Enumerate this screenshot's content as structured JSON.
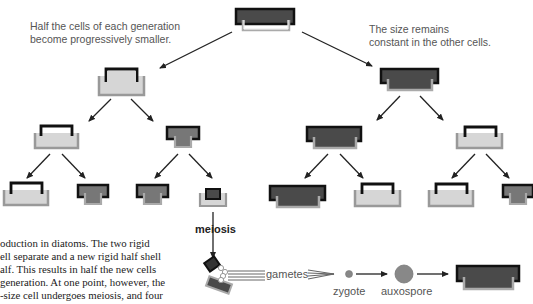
{
  "annotations": {
    "left_note_line1": "Half the cells of each generation",
    "left_note_line2": "become progressively smaller.",
    "right_note_line1": "The size remains",
    "right_note_line2": "constant in the other cells."
  },
  "labels": {
    "meiosis": "meiosis",
    "gametes": "gametes",
    "zygote": "zygote",
    "auxospore": "auxospore"
  },
  "caption_lines": [
    "oduction in diatoms. The two rigid",
    "ell separate and a new rigid half shell",
    "alf. This results in half the new cells",
    "generation. At one point, however, the",
    "-size cell undergoes meiosis, and four"
  ],
  "colors": {
    "dark_cell": "#4a4a4a",
    "mid_cell": "#777777",
    "light_cell": "#d6d6d6",
    "epitheca_border": "#111111",
    "hypotheca_border": "#999999",
    "arrow": "#222222",
    "zygote": "#888888"
  },
  "tree": {
    "root": {
      "type": "dark",
      "size": "large"
    },
    "generation_1": [
      {
        "type": "light",
        "size": "medium"
      },
      {
        "type": "dark",
        "size": "large"
      }
    ],
    "generation_2": [
      {
        "type": "light"
      },
      {
        "type": "mid"
      },
      {
        "type": "dark"
      },
      {
        "type": "light"
      }
    ],
    "generation_3": [
      {
        "type": "light"
      },
      {
        "type": "mid"
      },
      {
        "type": "mid"
      },
      {
        "type": "tiny"
      },
      {
        "type": "dark"
      },
      {
        "type": "light"
      },
      {
        "type": "light"
      },
      {
        "type": "mid"
      }
    ]
  }
}
